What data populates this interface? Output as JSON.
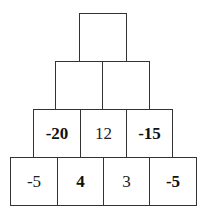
{
  "pyramid": {
    "rows": [
      {
        "cells": [
          {
            "value": "",
            "bold": false
          }
        ]
      },
      {
        "cells": [
          {
            "value": "",
            "bold": false
          },
          {
            "value": "",
            "bold": false
          }
        ]
      },
      {
        "cells": [
          {
            "value": "-20",
            "bold": true
          },
          {
            "value": "12",
            "bold": false
          },
          {
            "value": "-15",
            "bold": true
          }
        ]
      },
      {
        "cells": [
          {
            "value": "-5",
            "bold": false
          },
          {
            "value": "4",
            "bold": true
          },
          {
            "value": "3",
            "bold": false
          },
          {
            "value": "-5",
            "bold": true
          }
        ]
      }
    ]
  }
}
